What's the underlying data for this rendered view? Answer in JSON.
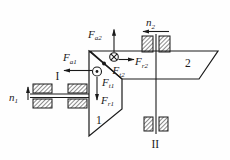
{
  "colors": {
    "ink": "#1a1a1a",
    "background": "#fefefe"
  },
  "shafts": {
    "shaft1": {
      "label": "I",
      "speed": {
        "base": "n",
        "sub": "1",
        "arrow": "up"
      }
    },
    "shaft2": {
      "label": "II",
      "speed": {
        "base": "n",
        "sub": "2",
        "arrow": "left"
      }
    }
  },
  "gears": {
    "gear1": {
      "label": "1"
    },
    "gear2": {
      "label": "2"
    }
  },
  "forces": {
    "fa1": {
      "base": "F",
      "sub": "a1",
      "arrow": "left"
    },
    "fa2": {
      "base": "F",
      "sub": "a2",
      "arrow": "up"
    },
    "ft1": {
      "base": "F",
      "sub": "t1",
      "arrow": "out-of-page"
    },
    "ft2": {
      "base": "F",
      "sub": "t2",
      "arrow": "into-page"
    },
    "fr1": {
      "base": "F",
      "sub": "r1",
      "arrow": "down"
    },
    "fr2": {
      "base": "F",
      "sub": "r2",
      "arrow": "right"
    }
  },
  "icons": {
    "ft1_symbol": "circle-dot-out-of-page",
    "ft2_symbol": "circle-cross-into-page",
    "mesh_point": "filled-dot",
    "bearing_blocks": "hatched-rectangle"
  }
}
